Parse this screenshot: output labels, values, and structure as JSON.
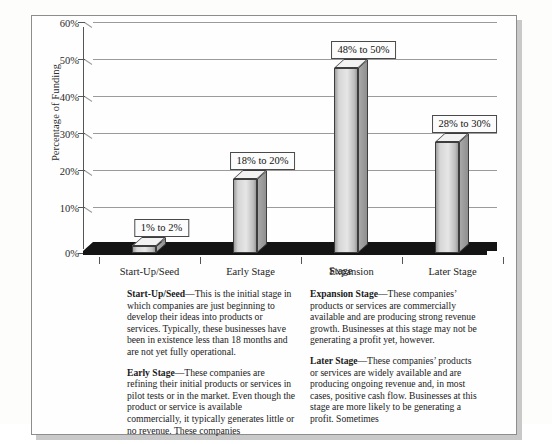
{
  "chart_data": {
    "type": "bar",
    "title": "",
    "xlabel": "Stage",
    "ylabel": "Percentage of Funding",
    "categories": [
      "Start-Up/Seed",
      "Early Stage",
      "Expansion",
      "Later Stage"
    ],
    "values": [
      2,
      20,
      50,
      30
    ],
    "value_labels": [
      "1% to 2%",
      "18% to 20%",
      "48% to 50%",
      "28% to 30%"
    ],
    "ylim": [
      0,
      60
    ],
    "yticks": [
      "0%",
      "10%",
      "20%",
      "30%",
      "40%",
      "50%",
      "60%"
    ],
    "ytick_values": [
      0,
      10,
      20,
      30,
      40,
      50,
      60
    ],
    "grid": true,
    "legend": "none",
    "style": "3d-column"
  },
  "chart": {
    "y_axis_title": "Percentage of Funding",
    "x_axis_title": "Stage"
  },
  "text_columns": {
    "left": [
      {
        "term": "Start-Up/Seed",
        "dash": "—",
        "body": "This is the initial stage in which companies are just beginning to develop their ideas into products or services. Typically, these businesses have been in existence less than 18 months and are not yet fully operational."
      },
      {
        "term": "Early Stage",
        "dash": "—",
        "body": "These companies are refining their initial products or services in pilot tests or in the market. Even though the product or service is available commercially, it typically generates little or no revenue. These companies"
      }
    ],
    "right": [
      {
        "term": "Expansion Stage",
        "dash": "—",
        "body": "These companies’ products or services are commercially available and are producing strong revenue growth. Businesses at this stage may not be generating a profit yet, however."
      },
      {
        "term": "Later Stage",
        "dash": "—",
        "body": "These companies’ products or services are widely available and are producing ongoing revenue and, in most cases, positive cash flow. Businesses at this stage are more likely to be generating a profit. Sometimes"
      }
    ]
  },
  "colors": {
    "bar_face": "#e2e2e2",
    "bar_outline": "#3d3d3d",
    "floor": "#141414",
    "gridline": "#9b9b9b",
    "frame": "#8d8d8d"
  }
}
